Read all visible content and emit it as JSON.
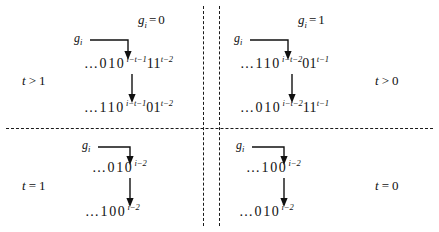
{
  "figure": {
    "quadrants": {
      "top_left": {
        "column_header": {
          "symbol": "g",
          "subscript": "i",
          "relation": "=",
          "value": "0"
        },
        "row_condition": {
          "variable": "t",
          "relation": ">",
          "value": "1"
        },
        "pointer_label": {
          "symbol": "g",
          "subscript": "i"
        },
        "from_string": {
          "prefix": "…010",
          "exp1": "i−t−1",
          "middle": "11",
          "exp2": "t−2"
        },
        "to_string": {
          "prefix": "…110",
          "exp1": "i−t−1",
          "middle": "01",
          "exp2": "t−2"
        }
      },
      "top_right": {
        "column_header": {
          "symbol": "g",
          "subscript": "i",
          "relation": "=",
          "value": "1"
        },
        "row_condition": {
          "variable": "t",
          "relation": ">",
          "value": "0"
        },
        "pointer_label": {
          "symbol": "g",
          "subscript": "i"
        },
        "from_string": {
          "prefix": "…110",
          "exp1": "i−t−2",
          "middle": "01",
          "exp2": "t−1"
        },
        "to_string": {
          "prefix": "…010",
          "exp1": "i−t−2",
          "middle": "11",
          "exp2": "t−1"
        }
      },
      "bottom_left": {
        "row_condition": {
          "variable": "t",
          "relation": "=",
          "value": "1"
        },
        "pointer_label": {
          "symbol": "g",
          "subscript": "i"
        },
        "from_string": {
          "prefix": "…010",
          "exp1": "i−2"
        },
        "to_string": {
          "prefix": "…100",
          "exp1": "i−2"
        }
      },
      "bottom_right": {
        "row_condition": {
          "variable": "t",
          "relation": "=",
          "value": "0"
        },
        "pointer_label": {
          "symbol": "g",
          "subscript": "i"
        },
        "from_string": {
          "prefix": "…100",
          "exp1": "i−2"
        },
        "to_string": {
          "prefix": "…010",
          "exp1": "i−2"
        }
      }
    },
    "colors": {
      "ink": "#111111",
      "background": "#ffffff"
    }
  }
}
